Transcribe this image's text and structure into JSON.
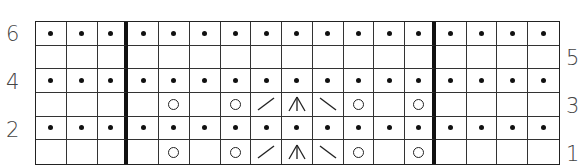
{
  "chart": {
    "title": "",
    "columns": 17,
    "rows": 6,
    "section_dividers_after_columns": [
      3,
      13
    ],
    "legend_symbols": {
      "purl": "dot",
      "knit": "empty",
      "yo": "circle",
      "k2tog": "slash-right",
      "ssk": "slash-left",
      "cdd": "double-decrease"
    },
    "row_labels_left": [
      {
        "row": 6,
        "label": "6"
      },
      {
        "row": 4,
        "label": "4"
      },
      {
        "row": 2,
        "label": "2"
      }
    ],
    "row_labels_right": [
      {
        "row": 5,
        "label": "5"
      },
      {
        "row": 3,
        "label": "3"
      },
      {
        "row": 1,
        "label": "1"
      }
    ],
    "grid_rows_top_to_bottom": [
      {
        "row": 6,
        "cells": [
          "purl",
          "purl",
          "purl",
          "purl",
          "purl",
          "purl",
          "purl",
          "purl",
          "purl",
          "purl",
          "purl",
          "purl",
          "purl",
          "purl",
          "purl",
          "purl",
          "purl"
        ]
      },
      {
        "row": 5,
        "cells": [
          "knit",
          "knit",
          "knit",
          "knit",
          "knit",
          "knit",
          "knit",
          "knit",
          "knit",
          "knit",
          "knit",
          "knit",
          "knit",
          "knit",
          "knit",
          "knit",
          "knit"
        ]
      },
      {
        "row": 4,
        "cells": [
          "purl",
          "purl",
          "purl",
          "purl",
          "purl",
          "purl",
          "purl",
          "purl",
          "purl",
          "purl",
          "purl",
          "purl",
          "purl",
          "purl",
          "purl",
          "purl",
          "purl"
        ]
      },
      {
        "row": 3,
        "cells": [
          "knit",
          "knit",
          "knit",
          "knit",
          "yo",
          "knit",
          "yo",
          "k2tog",
          "cdd",
          "ssk",
          "yo",
          "knit",
          "yo",
          "knit",
          "knit",
          "knit",
          "knit"
        ]
      },
      {
        "row": 2,
        "cells": [
          "purl",
          "purl",
          "purl",
          "purl",
          "purl",
          "purl",
          "purl",
          "purl",
          "purl",
          "purl",
          "purl",
          "purl",
          "purl",
          "purl",
          "purl",
          "purl",
          "purl"
        ]
      },
      {
        "row": 1,
        "cells": [
          "knit",
          "knit",
          "knit",
          "knit",
          "yo",
          "knit",
          "yo",
          "k2tog",
          "cdd",
          "ssk",
          "yo",
          "knit",
          "yo",
          "knit",
          "knit",
          "knit",
          "knit"
        ]
      }
    ]
  },
  "labels": {
    "l6": "6",
    "l4": "4",
    "l2": "2",
    "r5": "5",
    "r3": "3",
    "r1": "1"
  }
}
